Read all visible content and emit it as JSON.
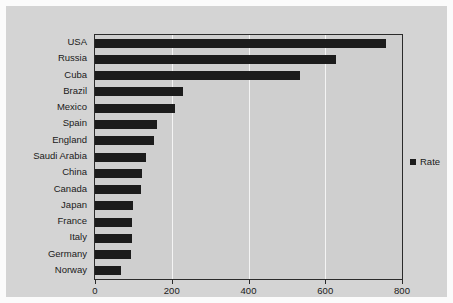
{
  "chart_data": {
    "type": "bar",
    "orientation": "horizontal",
    "title": "",
    "xlabel": "",
    "ylabel": "",
    "categories": [
      "USA",
      "Russia",
      "Cuba",
      "Brazil",
      "Mexico",
      "Spain",
      "England",
      "Saudi Arabia",
      "China",
      "Canada",
      "Japan",
      "France",
      "Italy",
      "Germany",
      "Norway"
    ],
    "values": [
      758,
      627,
      533,
      229,
      209,
      161,
      155,
      132,
      122,
      119,
      98,
      97,
      96,
      95,
      69
    ],
    "series": [
      {
        "name": "Rate",
        "values": [
          758,
          627,
          533,
          229,
          209,
          161,
          155,
          132,
          122,
          119,
          98,
          97,
          96,
          95,
          69
        ]
      }
    ],
    "xlim": [
      0,
      800
    ],
    "xticks": [
      0,
      200,
      400,
      600,
      800
    ],
    "xtick_labels": [
      "0",
      "200",
      "400",
      "600",
      "800"
    ],
    "grid": true,
    "grid_axis": "x",
    "legend": {
      "position": "right",
      "entries": [
        {
          "label": "Rate",
          "color": "#1c1c1c"
        }
      ]
    },
    "colors": {
      "bar": "#1c1c1c",
      "plot_background": "#cfcfcf",
      "canvas_background": "#d4d4d4",
      "page_background": "#fbfbfb",
      "gridline": "#f4f4f4",
      "axis": "#2b2b2b",
      "text": "#1a1a1a"
    }
  }
}
